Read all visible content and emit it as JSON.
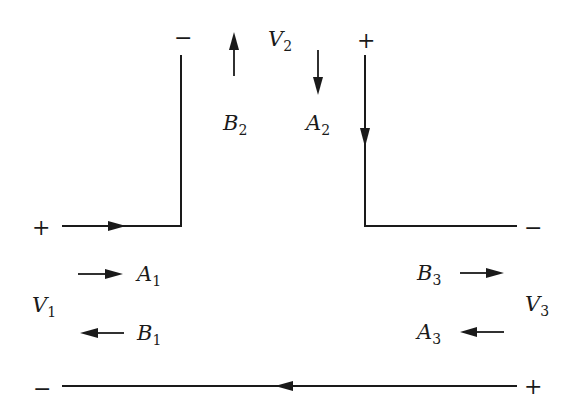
{
  "diagram": {
    "ports": [
      {
        "id": "port-1",
        "voltage_label": "V",
        "voltage_sub": "1",
        "plus_sign": "+",
        "minus_sign": "−",
        "incident_label": "A",
        "incident_sub": "1",
        "reflected_label": "B",
        "reflected_sub": "1"
      },
      {
        "id": "port-2",
        "voltage_label": "V",
        "voltage_sub": "2",
        "plus_sign": "+",
        "minus_sign": "−",
        "incident_label": "A",
        "incident_sub": "2",
        "reflected_label": "B",
        "reflected_sub": "2"
      },
      {
        "id": "port-3",
        "voltage_label": "V",
        "voltage_sub": "3",
        "plus_sign": "+",
        "minus_sign": "−",
        "incident_label": "A",
        "incident_sub": "3",
        "reflected_label": "B",
        "reflected_sub": "3"
      }
    ],
    "colors": {
      "ink": "#1a1a1a",
      "background": "#ffffff"
    }
  }
}
